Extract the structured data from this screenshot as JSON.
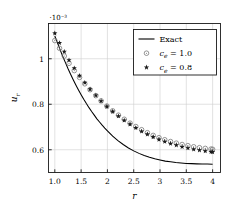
{
  "figure": {
    "background": "#ffffff",
    "axis_color": "#1a1a1a",
    "grid_color": "#cfcfcf",
    "curve_color": "#000000",
    "marker_circle_color": "#7a7a7a",
    "marker_star_color": "#1a1a1a"
  },
  "axes": {
    "exponent_label": "·10⁻³",
    "xlabel": "r",
    "ylabel": "u",
    "ylabel_sub": "r",
    "xticks": [
      "1.0",
      "1.5",
      "2",
      "2.5",
      "3",
      "3.5",
      "4"
    ],
    "yticks": [
      "0.6",
      "0.8",
      "1"
    ]
  },
  "legend": {
    "entries": [
      {
        "label": "Exact",
        "marker": "line",
        "math": false
      },
      {
        "label": "c",
        "sub": "e",
        "value": "= 1.0",
        "marker": "circle-dot-icon",
        "math": true
      },
      {
        "label": "c",
        "sub": "e",
        "value": "= 0.8",
        "marker": "star-icon",
        "math": true
      }
    ]
  },
  "chart_data": {
    "type": "line",
    "title": "",
    "xlabel": "r",
    "ylabel": "u_r",
    "y_scale_exponent": -3,
    "xlim": [
      0.88,
      4.15
    ],
    "ylim": [
      0.5,
      1.155
    ],
    "xticks": [
      1.0,
      1.5,
      2.0,
      2.5,
      3.0,
      3.5,
      4.0
    ],
    "yticks": [
      0.6,
      0.8,
      1.0
    ],
    "grid": true,
    "legend_position": "upper-right",
    "series": [
      {
        "name": "Exact",
        "style": "line",
        "x": [
          1.0,
          1.05,
          1.1,
          1.15,
          1.2,
          1.25,
          1.3,
          1.35,
          1.4,
          1.45,
          1.5,
          1.55,
          1.6,
          1.65,
          1.7,
          1.75,
          1.8,
          1.85,
          1.9,
          1.95,
          2.0,
          2.1,
          2.2,
          2.3,
          2.4,
          2.5,
          2.6,
          2.7,
          2.8,
          2.9,
          3.0,
          3.1,
          3.2,
          3.3,
          3.4,
          3.5,
          3.6,
          3.7,
          3.8,
          3.9,
          4.0
        ],
        "y": [
          1.1,
          1.07,
          1.04,
          1.011,
          0.984,
          0.957,
          0.932,
          0.908,
          0.885,
          0.863,
          0.842,
          0.822,
          0.803,
          0.785,
          0.768,
          0.752,
          0.736,
          0.722,
          0.708,
          0.695,
          0.683,
          0.66,
          0.64,
          0.623,
          0.608,
          0.595,
          0.584,
          0.575,
          0.567,
          0.56,
          0.555,
          0.55,
          0.547,
          0.544,
          0.542,
          0.54,
          0.539,
          0.538,
          0.537,
          0.537,
          0.536
        ]
      },
      {
        "name": "c_e = 1.0",
        "style": "markers",
        "marker": "circle-dot",
        "x": [
          1.0,
          1.09,
          1.18,
          1.27,
          1.37,
          1.47,
          1.57,
          1.67,
          1.78,
          1.88,
          1.99,
          2.1,
          2.21,
          2.32,
          2.43,
          2.54,
          2.65,
          2.76,
          2.87,
          2.98,
          3.09,
          3.2,
          3.31,
          3.42,
          3.53,
          3.64,
          3.75,
          3.86,
          3.97,
          4.0
        ],
        "y": [
          1.08,
          1.046,
          1.012,
          0.98,
          0.948,
          0.918,
          0.89,
          0.864,
          0.838,
          0.815,
          0.792,
          0.771,
          0.752,
          0.734,
          0.717,
          0.702,
          0.688,
          0.675,
          0.663,
          0.653,
          0.644,
          0.636,
          0.629,
          0.623,
          0.618,
          0.613,
          0.609,
          0.606,
          0.603,
          0.602
        ]
      },
      {
        "name": "c_e = 0.8",
        "style": "markers",
        "marker": "star",
        "x": [
          1.0,
          1.09,
          1.18,
          1.27,
          1.37,
          1.47,
          1.57,
          1.67,
          1.78,
          1.88,
          1.99,
          2.1,
          2.21,
          2.32,
          2.43,
          2.54,
          2.65,
          2.76,
          2.87,
          2.98,
          3.09,
          3.2,
          3.31,
          3.42,
          3.53,
          3.64,
          3.75,
          3.86,
          3.97,
          4.0
        ],
        "y": [
          1.112,
          1.07,
          1.031,
          0.994,
          0.959,
          0.926,
          0.895,
          0.866,
          0.839,
          0.814,
          0.79,
          0.768,
          0.748,
          0.729,
          0.712,
          0.696,
          0.681,
          0.668,
          0.656,
          0.645,
          0.636,
          0.627,
          0.62,
          0.613,
          0.607,
          0.602,
          0.598,
          0.594,
          0.591,
          0.59
        ]
      }
    ]
  }
}
